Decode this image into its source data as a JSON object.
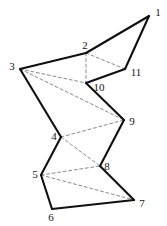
{
  "figure": {
    "type": "polygon-triangulation-diagram",
    "canvas": {
      "width": 167,
      "height": 226,
      "background": "#ffffff"
    },
    "styles": {
      "boundary_color": "#101010",
      "boundary_width": 2.1,
      "diagonal_color": "#8a8a8a",
      "diagonal_width": 1.0,
      "diagonal_dash": "3,2.6",
      "label_color": "#151515",
      "label_font_size": "11px"
    },
    "vertices": [
      {
        "id": "1",
        "x": 149,
        "y": 16,
        "label": "1",
        "label_x": 158,
        "label_y": 12
      },
      {
        "id": "2",
        "x": 86,
        "y": 53,
        "label": "2",
        "label_x": 85,
        "label_y": 45
      },
      {
        "id": "3",
        "x": 20,
        "y": 69,
        "label": "3",
        "label_x": 12,
        "label_y": 66
      },
      {
        "id": "4",
        "x": 61,
        "y": 137,
        "label": "4",
        "label_x": 54,
        "label_y": 136
      },
      {
        "id": "5",
        "x": 41,
        "y": 175,
        "label": "5",
        "label_x": 35,
        "label_y": 174
      },
      {
        "id": "6",
        "x": 52,
        "y": 209,
        "label": "6",
        "label_x": 51,
        "label_y": 217
      },
      {
        "id": "7",
        "x": 134,
        "y": 200,
        "label": "7",
        "label_x": 142,
        "label_y": 203
      },
      {
        "id": "8",
        "x": 100,
        "y": 166,
        "label": "8",
        "label_x": 107,
        "label_y": 166
      },
      {
        "id": "9",
        "x": 124,
        "y": 120,
        "label": "9",
        "label_x": 132,
        "label_y": 121
      },
      {
        "id": "10",
        "x": 86,
        "y": 83,
        "label": "10",
        "label_x": 99,
        "label_y": 87
      },
      {
        "id": "11",
        "x": 125,
        "y": 69,
        "label": "11",
        "label_x": 136,
        "label_y": 72
      }
    ],
    "boundary_edges": [
      [
        "1",
        "2"
      ],
      [
        "2",
        "3"
      ],
      [
        "3",
        "4"
      ],
      [
        "4",
        "5"
      ],
      [
        "5",
        "6"
      ],
      [
        "6",
        "7"
      ],
      [
        "7",
        "8"
      ],
      [
        "8",
        "9"
      ],
      [
        "9",
        "10"
      ],
      [
        "10",
        "11"
      ],
      [
        "11",
        "1"
      ]
    ],
    "diagonals": [
      [
        "2",
        "10"
      ],
      [
        "2",
        "11"
      ],
      [
        "3",
        "2"
      ],
      [
        "3",
        "10"
      ],
      [
        "3",
        "9"
      ],
      [
        "3",
        "4"
      ],
      [
        "4",
        "9"
      ],
      [
        "4",
        "8"
      ],
      [
        "5",
        "8"
      ],
      [
        "5",
        "7"
      ]
    ]
  }
}
